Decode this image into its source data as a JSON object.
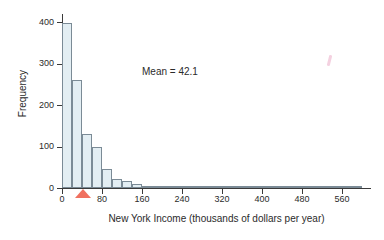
{
  "chart_data": {
    "type": "bar",
    "title": "",
    "subtitle": "",
    "xlabel": "New York Income (thousands of dollars per year)",
    "ylabel": "Frequency",
    "xlim": [
      0,
      616
    ],
    "ylim": [
      0,
      400
    ],
    "bin_width": 20,
    "grid": false,
    "legend": null,
    "xticks": [
      0,
      80,
      160,
      240,
      320,
      400,
      480,
      560
    ],
    "xtick_labels": [
      "0",
      "80",
      "160",
      "240",
      "320",
      "400",
      "480",
      "560"
    ],
    "yticks": [
      0,
      100,
      200,
      300,
      400
    ],
    "ytick_labels": [
      "0",
      "100",
      "200",
      "300",
      "400"
    ],
    "bin_starts": [
      0,
      20,
      40,
      60,
      80,
      100,
      120,
      140,
      160,
      180,
      200,
      220,
      240,
      260,
      280,
      300,
      320,
      340,
      360,
      380,
      400,
      420,
      440,
      460,
      480,
      500,
      520,
      540,
      560,
      580
    ],
    "values": [
      397,
      260,
      131,
      98,
      46,
      22,
      16,
      9,
      3,
      2,
      2,
      2,
      1,
      1,
      1,
      1,
      1,
      5,
      4,
      1,
      1,
      1,
      1,
      1,
      4,
      3,
      1,
      1,
      2,
      1
    ],
    "annotations": [
      {
        "name": "mean-label",
        "text": "Mean = 42.1",
        "value": 42.1
      },
      {
        "name": "mean-marker",
        "text": "",
        "value": 42.1,
        "color": "#f0705f",
        "shape": "triangle-up"
      }
    ],
    "bar_fill_color": "#e3eef3",
    "bar_edge_color": "#7b8b96",
    "axis_color": "#3a3a3a"
  },
  "axes": {
    "y_title": "Frequency",
    "x_title": "New York Income (thousands of dollars per year)"
  },
  "annotation": {
    "mean_text": "Mean = 42.1"
  }
}
